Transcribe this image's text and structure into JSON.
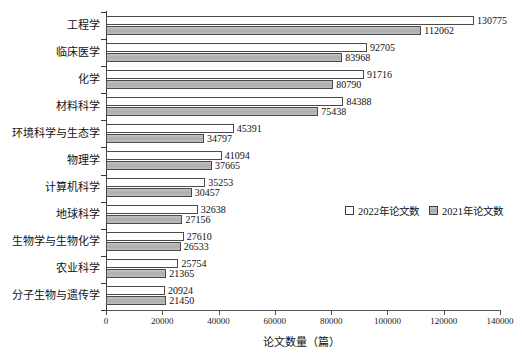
{
  "chart_data": {
    "type": "bar",
    "orientation": "horizontal",
    "title": "",
    "xlabel": "论文数量（篇）",
    "ylabel": "",
    "xlim": [
      0,
      140000
    ],
    "xticks": [
      0,
      20000,
      40000,
      60000,
      80000,
      100000,
      120000,
      140000
    ],
    "xticklabels": [
      "0",
      "20000",
      "40000",
      "60000",
      "80000",
      "100000",
      "120000",
      "140000"
    ],
    "grid": false,
    "legend_position": "center-right",
    "categories": [
      "工程学",
      "临床医学",
      "化学",
      "材料科学",
      "环境科学与生态学",
      "物理学",
      "计算机科学",
      "地球科学",
      "生物学与生物化学",
      "农业科学",
      "分子生物与遗传学"
    ],
    "series": [
      {
        "name": "2022年论文数",
        "color": "#ffffff",
        "values": [
          130775,
          92705,
          91716,
          84388,
          45391,
          41094,
          35253,
          32638,
          27610,
          25754,
          20924
        ]
      },
      {
        "name": "2021年论文数",
        "color": "#b4b4b4",
        "values": [
          112062,
          83968,
          80790,
          75438,
          34797,
          37665,
          30457,
          27156,
          26533,
          21365,
          21450
        ]
      }
    ]
  },
  "legend": {
    "items": [
      {
        "label": "2022年论文数",
        "swatch": "white-square-icon"
      },
      {
        "label": "2021年论文数",
        "swatch": "gray-square-icon"
      }
    ]
  },
  "axis": {
    "x_title": "论文数量（篇）"
  }
}
